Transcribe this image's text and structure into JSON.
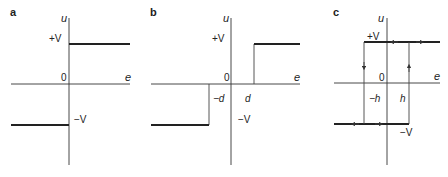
{
  "figure": {
    "panels": [
      {
        "id": "a",
        "label": "a",
        "title": "Ideal relay",
        "y_axis_label": "u",
        "x_axis_label": "e",
        "origin_label": "0",
        "upper_level_label": "+V",
        "lower_level_label": "−V"
      },
      {
        "id": "b",
        "label": "b",
        "title": "Relay with dead zone",
        "y_axis_label": "u",
        "x_axis_label": "e",
        "origin_label": "0",
        "upper_level_label": "+V",
        "lower_level_label": "−V",
        "neg_threshold_label": "−d",
        "pos_threshold_label": "d"
      },
      {
        "id": "c",
        "label": "c",
        "title": "Relay with hysteresis",
        "y_axis_label": "u",
        "x_axis_label": "e",
        "origin_label": "0",
        "upper_level_label": "+V",
        "lower_level_label": "−V",
        "neg_threshold_label": "−h",
        "pos_threshold_label": "h"
      }
    ]
  }
}
